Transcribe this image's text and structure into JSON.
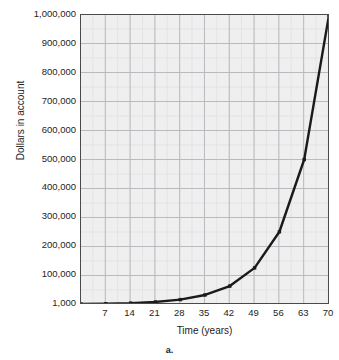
{
  "figure": {
    "caption": "a.",
    "title_remnant": ""
  },
  "chart_data": {
    "type": "line",
    "title": "",
    "xlabel": "Time (years)",
    "ylabel": "Dollars in account",
    "x": [
      0,
      7,
      14,
      21,
      28,
      35,
      42,
      49,
      56,
      63,
      70
    ],
    "values": [
      1000,
      2000,
      4000,
      8000,
      16000,
      32000,
      62500,
      125000,
      250000,
      500000,
      1000000
    ],
    "series": [
      {
        "name": "Dollars in account",
        "values": [
          1000,
          2000,
          4000,
          8000,
          16000,
          32000,
          62500,
          125000,
          250000,
          500000,
          1000000
        ]
      }
    ],
    "xtick_labels": [
      "7",
      "14",
      "21",
      "28",
      "35",
      "42",
      "49",
      "56",
      "63",
      "70"
    ],
    "xtick_values": [
      7,
      14,
      21,
      28,
      35,
      42,
      49,
      56,
      63,
      70
    ],
    "ytick_labels": [
      "1,000,000",
      "900,000",
      "800,000",
      "700,000",
      "600,000",
      "500,000",
      "400,000",
      "300,000",
      "200,000",
      "100,000",
      "1,000"
    ],
    "ytick_values": [
      1000000,
      900000,
      800000,
      700000,
      600000,
      500000,
      400000,
      300000,
      200000,
      100000,
      1000
    ],
    "xlim": [
      0,
      70
    ],
    "ylim": [
      1000,
      1000000
    ],
    "grid": true,
    "minor_grid": true,
    "legend": "none",
    "line_color": "#1a1a1a",
    "marker": "square",
    "plot_background": "#efefef",
    "grid_major_color": "#b9b9be",
    "grid_minor_color": "#e3e3e6",
    "axis_color": "#4a4a4a"
  }
}
